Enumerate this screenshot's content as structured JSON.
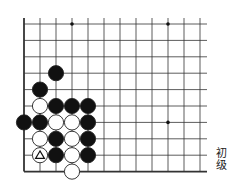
{
  "diagram": {
    "type": "go-board-fragment",
    "grid": {
      "origin_x": 24,
      "origin_y": 24,
      "spacing_x": 16,
      "spacing_y": 16.4,
      "cols": 12,
      "rows": 10,
      "right_extent": 207,
      "left_edge": true,
      "bottom_edge": true,
      "line_color": "#333333"
    },
    "star_points": [
      {
        "col": 3,
        "row": 0
      },
      {
        "col": 9,
        "row": 0
      },
      {
        "col": 9,
        "row": 6
      }
    ],
    "stones": [
      {
        "color": "black",
        "col": 2,
        "row": 3
      },
      {
        "color": "black",
        "col": 1,
        "row": 4
      },
      {
        "color": "white",
        "col": 1,
        "row": 5
      },
      {
        "color": "black",
        "col": 2,
        "row": 5
      },
      {
        "color": "black",
        "col": 3,
        "row": 5
      },
      {
        "color": "black",
        "col": 4,
        "row": 5
      },
      {
        "color": "black",
        "col": 0,
        "row": 6
      },
      {
        "color": "black",
        "col": 1,
        "row": 6
      },
      {
        "color": "white",
        "col": 2,
        "row": 6
      },
      {
        "color": "white",
        "col": 3,
        "row": 6
      },
      {
        "color": "black",
        "col": 4,
        "row": 6
      },
      {
        "color": "white",
        "col": 1,
        "row": 7
      },
      {
        "color": "black",
        "col": 2,
        "row": 7
      },
      {
        "color": "white",
        "col": 3,
        "row": 7
      },
      {
        "color": "black",
        "col": 4,
        "row": 7
      },
      {
        "color": "white",
        "col": 1,
        "row": 8,
        "mark": "triangle"
      },
      {
        "color": "black",
        "col": 2,
        "row": 8
      },
      {
        "color": "white",
        "col": 3,
        "row": 8
      },
      {
        "color": "black",
        "col": 4,
        "row": 8
      },
      {
        "color": "white",
        "col": 3,
        "row": 9
      }
    ],
    "colors": {
      "black_stone": "#111111",
      "white_stone": "#ffffff",
      "stone_outline": "#222222"
    }
  },
  "level_label": {
    "line1": "初",
    "line2": "级"
  }
}
